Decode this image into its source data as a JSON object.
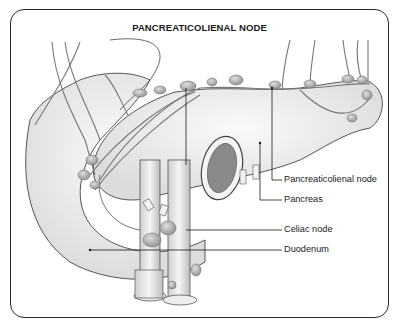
{
  "diagram": {
    "title": "PANCREATICOLIENAL NODE",
    "labels": [
      {
        "id": "pancreaticolienal-node",
        "text": "Pancreaticolienal node"
      },
      {
        "id": "pancreas",
        "text": "Pancreas"
      },
      {
        "id": "celiac-node",
        "text": "Celiac node"
      },
      {
        "id": "duodenum",
        "text": "Duodenum"
      }
    ],
    "colors": {
      "ink": "#2a2a2a",
      "tissue": "#e9e9e9",
      "node": "#b9b9b9",
      "background": "#ffffff"
    }
  }
}
